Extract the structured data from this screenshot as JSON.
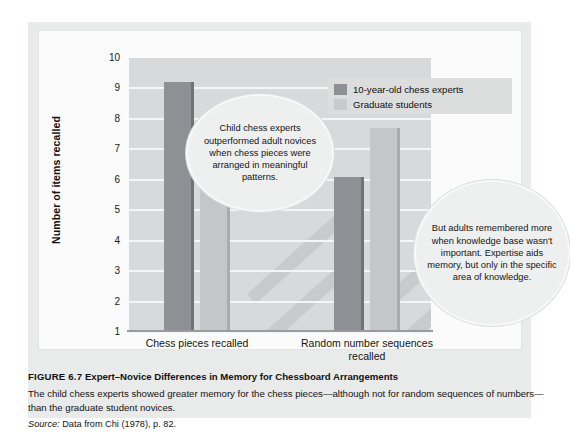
{
  "figure": {
    "label": "FIGURE 6.7",
    "title": "Expert–Novice Differences in Memory for Chessboard Arrangements",
    "body": "The child chess experts showed greater memory for the chess pieces—although not for random sequences of numbers—than the graduate student novices.",
    "source_label": "Source:",
    "source_text": "Data from Chi (1978), p. 82."
  },
  "callouts": [
    {
      "id": "bubble-1",
      "text": "Child chess experts outperformed adult novices when chess pieces were arranged in meaningful patterns."
    },
    {
      "id": "bubble-2",
      "text": "But adults remembered more when knowledge base wasn't important. Expertise aids memory, but only in the specific area of knowledge."
    }
  ],
  "colors": {
    "experts": "#8d9094",
    "graduates": "#c4c6c8",
    "plot_background": "#d8d9da",
    "panel_background": "#e9eaea",
    "gridline": "#f4f5f5"
  },
  "chart_data": {
    "type": "bar",
    "title": "Expert–Novice Differences in Memory for Chessboard Arrangements",
    "xlabel": "",
    "ylabel": "Number of items recalled",
    "ylim": [
      1,
      10
    ],
    "yticks": [
      1,
      2,
      3,
      4,
      5,
      6,
      7,
      8,
      9,
      10
    ],
    "grid": true,
    "legend_position": "top-right",
    "categories": [
      "Chess pieces recalled",
      "Random number sequences recalled"
    ],
    "series": [
      {
        "name": "10-year-old chess experts",
        "values": [
          9.2,
          6.1
        ],
        "color": "#8d9094"
      },
      {
        "name": "Graduate students",
        "values": [
          5.8,
          7.7
        ],
        "color": "#c4c6c8"
      }
    ]
  }
}
